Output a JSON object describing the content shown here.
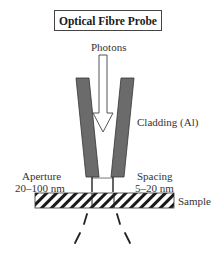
{
  "title": "Optical Fibre Probe",
  "labels": {
    "photons": "Photons",
    "cladding": "Cladding (Al)",
    "aperture_line1": "Aperture",
    "aperture_line2": "20–100 nm",
    "spacing_line1": "Spacing",
    "spacing_line2": "5–20 nm",
    "sample": "Sample"
  },
  "colors": {
    "cladding_fill": "#6b6b6b",
    "outline": "#333333",
    "hatch": "#1a1a1a"
  }
}
